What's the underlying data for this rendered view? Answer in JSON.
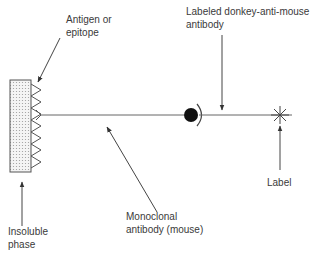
{
  "diagram": {
    "labels": {
      "antigen": "Antigen or\nepitope",
      "secondary_antibody": "Labeled donkey-anti-mouse\nantibody",
      "insoluble_phase": "Insoluble\nphase",
      "monoclonal": "Monoclonal\nantibody (mouse)",
      "label": "Label"
    },
    "colors": {
      "line": "#555555",
      "fill_dots": "#9a9a9a",
      "circle": "#111111"
    }
  }
}
